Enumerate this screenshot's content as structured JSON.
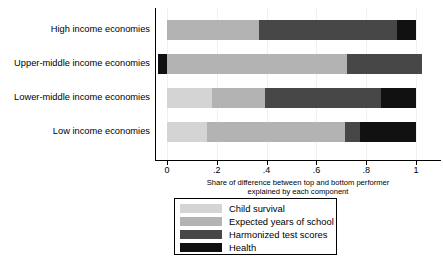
{
  "chart_data": {
    "type": "bar",
    "orientation": "horizontal",
    "stacked": true,
    "title": "",
    "xlabel": "Share of difference between top and bottom performer explained by each component",
    "ylabel": "",
    "xlim": [
      -0.06,
      1.08
    ],
    "xticks": [
      0,
      0.2,
      0.4,
      0.6,
      0.8,
      1
    ],
    "xtick_labels": [
      "0",
      ".2",
      ".4",
      ".6",
      ".8",
      "1"
    ],
    "grid": false,
    "legend_position": "below",
    "categories": [
      "High income economies",
      "Upper-middle income economies",
      "Lower-middle income economies",
      "Low income economies"
    ],
    "series": [
      {
        "name": "Child survival",
        "color": "#d4d4d4",
        "values": [
          0.0,
          0.0,
          0.18,
          0.16
        ]
      },
      {
        "name": "Expected years of school",
        "color": "#b3b3b3",
        "values": [
          0.37,
          0.724,
          0.213,
          0.555
        ]
      },
      {
        "name": "Harmonized test scores",
        "color": "#474747",
        "values": [
          0.555,
          0.301,
          0.466,
          0.06
        ]
      },
      {
        "name": "Health",
        "color": "#111111",
        "values": [
          0.075,
          -0.035,
          0.141,
          0.225
        ]
      }
    ]
  },
  "axis": {
    "x_title_line1": "Share of difference between top and bottom performer",
    "x_title_line2": "explained by each component"
  },
  "legend": {
    "items": [
      {
        "label": "Child survival",
        "color": "#d4d4d4"
      },
      {
        "label": "Expected years of school",
        "color": "#b3b3b3"
      },
      {
        "label": "Harmonized test scores",
        "color": "#474747"
      },
      {
        "label": "Health",
        "color": "#111111"
      }
    ]
  }
}
